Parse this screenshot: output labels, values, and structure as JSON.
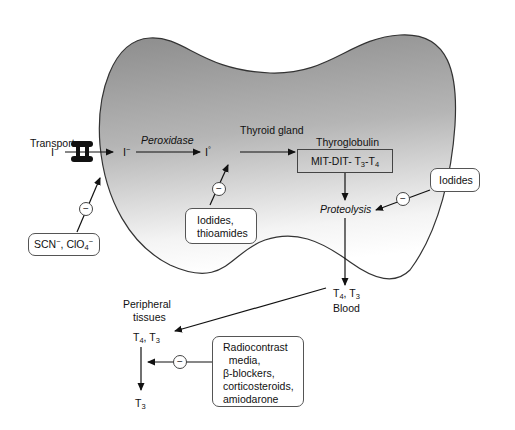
{
  "gland": {
    "label": "Thyroid gland",
    "fill_top": "#8f8f8f",
    "fill_bottom": "#ffffff",
    "outline": "#333333"
  },
  "pathway": {
    "transport_label": "Transport",
    "iodide_outside": "I",
    "iodide_outside_charge": "−",
    "iodide_inside": "I",
    "iodide_inside_charge": "−",
    "peroxidase_label": "Peroxidase",
    "iodine_active": "I",
    "iodine_active_mark": "°",
    "thyroglobulin_label": "Thyroglobulin",
    "thyroglobulin_box": {
      "prefix": "MIT-DIT- T",
      "sub1": "3",
      "mid": "-T",
      "sub2": "4"
    },
    "proteolysis_label": "Proteolysis",
    "blood_hormones": {
      "t_a": "T",
      "sub_a": "4",
      "sep": ", T",
      "sub_b": "3"
    },
    "blood_label": "Blood",
    "peripheral_label_line1": "Peripheral",
    "peripheral_label_line2": "tissues",
    "peripheral_hormones": {
      "t_a": "T",
      "sub_a": "4",
      "sep": ", T",
      "sub_b": "3"
    },
    "peripheral_product": {
      "t": "T",
      "sub": "3"
    }
  },
  "inhibitors": [
    {
      "id": "scn",
      "text_a": "SCN",
      "sup_a": "−",
      "text_b": ", ClO",
      "sub_b": "4",
      "sup_b": "−",
      "target": "Transport"
    },
    {
      "id": "iodides-thioamides",
      "line1": "Iodides,",
      "line2": "thioamides",
      "target": "Peroxidase / organification"
    },
    {
      "id": "iodides",
      "line1": "Iodides",
      "target": "Proteolysis"
    },
    {
      "id": "peripheral",
      "lines": [
        "Radiocontrast",
        "  media,",
        "β-blockers,",
        "corticosteroids,",
        "amiodarone"
      ],
      "target": "T4 to T3 conversion"
    }
  ],
  "inhibit_symbol": "−"
}
